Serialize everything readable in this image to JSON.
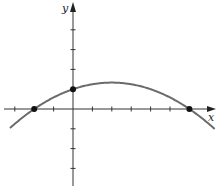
{
  "diagram": {
    "type": "function-graph",
    "axes": {
      "x_label": "x",
      "y_label": "y",
      "x_ticks": [
        -3,
        -2,
        -1,
        1,
        2,
        3,
        4,
        5,
        6
      ],
      "y_ticks": [
        -3,
        -2,
        -1,
        1,
        2,
        3,
        4
      ],
      "x_range": [
        -3.7,
        7.2
      ],
      "y_range": [
        -4,
        5.4
      ]
    },
    "curve": {
      "kind": "parabola",
      "opens": "down",
      "x_intercepts": [
        -2,
        6
      ],
      "y_intercept": 1,
      "vertex": [
        2,
        1.33
      ],
      "color": "#6b6b6b"
    },
    "points": [
      {
        "name": "x-intercept-left",
        "x": -2,
        "y": 0
      },
      {
        "name": "y-intercept",
        "x": 0,
        "y": 1
      },
      {
        "name": "x-intercept-right",
        "x": 6,
        "y": 0
      }
    ],
    "colors": {
      "axis": "#333333",
      "curve": "#6b6b6b",
      "point": "#111111"
    }
  }
}
